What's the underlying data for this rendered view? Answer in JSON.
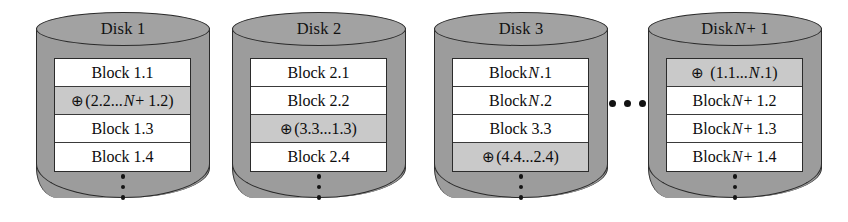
{
  "figure": {
    "kind": "raid-disk-layout-diagram",
    "horizontal_ellipsis": "...",
    "vertical_ellipsis": "⋮"
  },
  "colors": {
    "cylinder_fill": "#9c9c9c",
    "cylinder_top_fill": "#a2a2a2",
    "outline": "#2b2b2b",
    "block_fill": "#ffffff",
    "parity_fill": "#c9c9c9",
    "text": "#0d0d0d",
    "page_background": "#ffffff"
  },
  "disks": [
    {
      "id": "disk-1",
      "title_prefix": "Disk 1",
      "title_italic": "",
      "title_suffix": "",
      "x": 36,
      "rows": [
        {
          "id": "block-1-1",
          "parity": false,
          "symbol": "",
          "prefix": "Block 1.1",
          "italic": "",
          "suffix": ""
        },
        {
          "id": "parity-1",
          "parity": true,
          "symbol": "⊕",
          "prefix": "(2.2...",
          "italic": "N",
          "suffix": " + 1.2)"
        },
        {
          "id": "block-1-3",
          "parity": false,
          "symbol": "",
          "prefix": "Block 1.3",
          "italic": "",
          "suffix": ""
        },
        {
          "id": "block-1-4",
          "parity": false,
          "symbol": "",
          "prefix": "Block 1.4",
          "italic": "",
          "suffix": ""
        }
      ]
    },
    {
      "id": "disk-2",
      "title_prefix": "Disk 2",
      "title_italic": "",
      "title_suffix": "",
      "x": 232,
      "rows": [
        {
          "id": "block-2-1",
          "parity": false,
          "symbol": "",
          "prefix": "Block 2.1",
          "italic": "",
          "suffix": ""
        },
        {
          "id": "block-2-2",
          "parity": false,
          "symbol": "",
          "prefix": "Block 2.2",
          "italic": "",
          "suffix": ""
        },
        {
          "id": "parity-2",
          "parity": true,
          "symbol": "⊕",
          "prefix": "(3.3...1.3)",
          "italic": "",
          "suffix": ""
        },
        {
          "id": "block-2-4",
          "parity": false,
          "symbol": "",
          "prefix": "Block 2.4",
          "italic": "",
          "suffix": ""
        }
      ]
    },
    {
      "id": "disk-3",
      "title_prefix": "Disk 3",
      "title_italic": "",
      "title_suffix": "",
      "x": 434,
      "rows": [
        {
          "id": "block-n-1",
          "parity": false,
          "symbol": "",
          "prefix": "Block ",
          "italic": "N",
          "suffix": ".1"
        },
        {
          "id": "block-n-2",
          "parity": false,
          "symbol": "",
          "prefix": "Block ",
          "italic": "N",
          "suffix": ".2"
        },
        {
          "id": "block-3-3",
          "parity": false,
          "symbol": "",
          "prefix": "Block 3.3",
          "italic": "",
          "suffix": ""
        },
        {
          "id": "parity-3",
          "parity": true,
          "symbol": "⊕",
          "prefix": "(4.4...2.4)",
          "italic": "",
          "suffix": ""
        }
      ]
    },
    {
      "id": "disk-n-plus-1",
      "title_prefix": "Disk ",
      "title_italic": "N",
      "title_suffix": " + 1",
      "x": 648,
      "rows": [
        {
          "id": "parity-n-plus-1",
          "parity": true,
          "symbol": "⊕",
          "spaced": true,
          "prefix": "(1.1...",
          "italic": "N",
          "suffix": ".1)"
        },
        {
          "id": "block-n1-2",
          "parity": false,
          "symbol": "",
          "prefix": "Block ",
          "italic": "N",
          "suffix": " + 1.2"
        },
        {
          "id": "block-n1-3",
          "parity": false,
          "symbol": "",
          "prefix": "Block ",
          "italic": "N",
          "suffix": " + 1.3"
        },
        {
          "id": "block-n1-4",
          "parity": false,
          "symbol": "",
          "prefix": "Block ",
          "italic": "N",
          "suffix": " + 1.4"
        }
      ]
    }
  ]
}
